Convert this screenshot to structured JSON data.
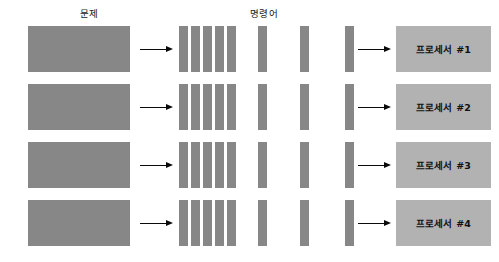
{
  "figure": {
    "background_color": "#ffffff",
    "block_color": "#878787",
    "processor_color": "#b2b2b2",
    "arrow_color": "#0a0a0a"
  },
  "headers": {
    "problem": "문제",
    "instruction": "명령어"
  },
  "rows": [
    {
      "processor_label": "프로세서 #1"
    },
    {
      "processor_label": "프로세서 #2"
    },
    {
      "processor_label": "프로세서 #3"
    },
    {
      "processor_label": "프로세서 #4"
    }
  ],
  "instruction_bars": {
    "count_per_row": 8,
    "bar_width": 9,
    "x_positions": [
      179,
      191,
      203,
      215,
      227,
      258,
      300,
      345
    ]
  }
}
